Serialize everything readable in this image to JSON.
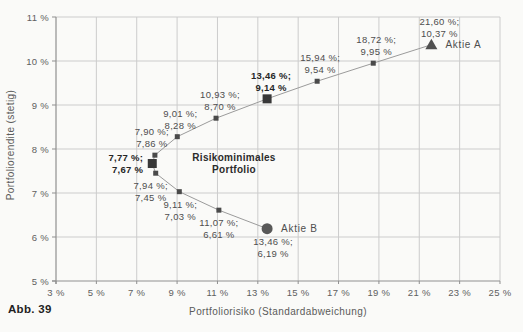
{
  "figure": {
    "caption": "Abb. 39"
  },
  "chart_data": {
    "type": "line",
    "title": "",
    "xlabel": "Portfoliorisiko (Standardabweichung)",
    "ylabel": "Portfoliorendite (stetig)",
    "xlim": [
      3,
      25
    ],
    "ylim": [
      5,
      11
    ],
    "xticks": [
      3,
      5,
      7,
      9,
      11,
      13,
      15,
      17,
      19,
      21,
      23,
      25
    ],
    "yticks": [
      5,
      6,
      7,
      8,
      9,
      10,
      11
    ],
    "tick_suffix": " %",
    "grid": true,
    "legend": "none",
    "colors": {
      "background": "#fafaf8",
      "grid": "#cccccc",
      "axis": "#8f8f8f",
      "line": "#9b9b9b",
      "marker": "#4a4a4a",
      "marker_bold": "#383838"
    },
    "series": [
      {
        "name": "Effizienzkurve",
        "points": [
          {
            "x": 21.6,
            "y": 10.37,
            "marker": "triangle",
            "label": [
              "21,60 %;",
              "10,37 %"
            ],
            "pos": "above",
            "dx": 8,
            "bold": false,
            "name": "Aktie A"
          },
          {
            "x": 18.72,
            "y": 9.95,
            "marker": "square",
            "label": [
              "18,72 %;",
              "9,95 %"
            ],
            "pos": "above",
            "dx": 3,
            "bold": false
          },
          {
            "x": 15.94,
            "y": 9.54,
            "marker": "square",
            "label": [
              "15,94 %;",
              "9,54 %"
            ],
            "pos": "above",
            "dx": 3,
            "bold": false
          },
          {
            "x": 13.46,
            "y": 9.14,
            "marker": "square-large",
            "label": [
              "13,46 %;",
              "9,14 %"
            ],
            "pos": "above",
            "dx": 4,
            "bold": true
          },
          {
            "x": 10.93,
            "y": 8.7,
            "marker": "square",
            "label": [
              "10,93 %;",
              "8,70 %"
            ],
            "pos": "above",
            "dx": 4,
            "bold": false
          },
          {
            "x": 9.01,
            "y": 8.28,
            "marker": "square",
            "label": [
              "9,01 %;",
              "8,28 %"
            ],
            "pos": "above",
            "dx": 3,
            "bold": false
          },
          {
            "x": 7.9,
            "y": 7.86,
            "marker": "square",
            "label": [
              "7,90 %;",
              "7,86 %"
            ],
            "pos": "above",
            "dx": -3,
            "bold": false
          },
          {
            "x": 7.77,
            "y": 7.67,
            "marker": "square-large",
            "label": [
              "7,77 %;",
              "7,67 %"
            ],
            "pos": "left",
            "dx": -9,
            "bold": true
          },
          {
            "x": 7.94,
            "y": 7.45,
            "marker": "square",
            "label": [
              "7,94 %;",
              "7,45 %"
            ],
            "pos": "below",
            "dx": -5,
            "bold": false
          },
          {
            "x": 9.11,
            "y": 7.03,
            "marker": "square",
            "label": [
              "9,11 %;",
              "7,03 %"
            ],
            "pos": "below",
            "dx": 1,
            "bold": false
          },
          {
            "x": 11.07,
            "y": 6.61,
            "marker": "square",
            "label": [
              "11,07 %;",
              "6,61 %"
            ],
            "pos": "below",
            "dx": 0,
            "bold": false
          },
          {
            "x": 13.46,
            "y": 6.19,
            "marker": "circle",
            "label": [
              "13,46 %;",
              "6,19 %"
            ],
            "pos": "below",
            "dx": 6,
            "bold": false,
            "name": "Aktie B"
          }
        ]
      }
    ],
    "annotations": [
      {
        "lines": [
          "Risikominimales",
          "Portfolio"
        ],
        "x": 11.82,
        "y": 7.62,
        "bold": true
      }
    ]
  }
}
